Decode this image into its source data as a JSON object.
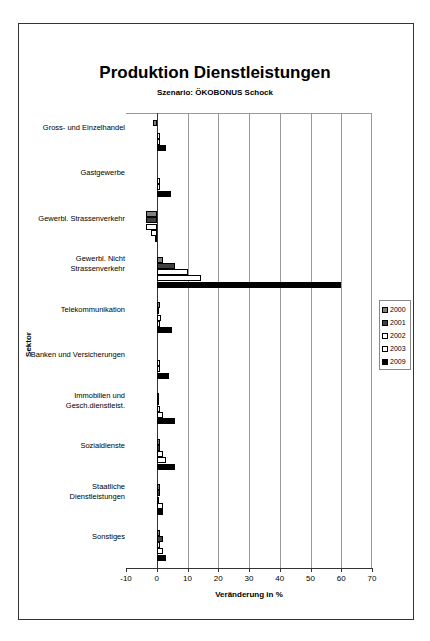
{
  "chart_data": {
    "type": "bar",
    "orientation": "horizontal",
    "title": "Produktion Dienstleistungen",
    "subtitle": "Szenario: ÖKOBONUS Schock",
    "xlabel": "Veränderung in %",
    "ylabel": "Sektor",
    "xlim": [
      -10,
      70
    ],
    "xticks": [
      "-10",
      "0",
      "10",
      "20",
      "30",
      "40",
      "50",
      "60",
      "70"
    ],
    "grid": true,
    "legend_position": "right",
    "categories": [
      "Gross- und Einzelhandel",
      "Gastgewerbe",
      "Gewerbl. Strassenverkehr",
      "Gewerbl. Nicht Strassenverkehr",
      "Telekommunikation",
      "Banken und Versicherungen",
      "Immobilien und Gesch.dienstleist.",
      "Sozialdienste",
      "Staatliche Dienstleistungen",
      "Sonstiges"
    ],
    "series": [
      {
        "name": "2000",
        "color": "#808080",
        "values": [
          -1.2,
          0,
          -3.5,
          2,
          1,
          0,
          0.5,
          1,
          1,
          1
        ]
      },
      {
        "name": "2001",
        "color": "#404040",
        "values": [
          0,
          0,
          -3.5,
          6,
          0.5,
          0,
          0.5,
          1,
          1,
          2
        ]
      },
      {
        "name": "2002",
        "color": "#ffffff",
        "values": [
          1,
          1,
          -3.5,
          10,
          1.5,
          1,
          1,
          2,
          0.5,
          1
        ]
      },
      {
        "name": "2003",
        "color": "#ffffff",
        "values": [
          1,
          1,
          -2,
          14.5,
          1,
          1,
          2,
          3,
          2,
          2
        ]
      },
      {
        "name": "2009",
        "color": "#000000",
        "values": [
          3,
          4.5,
          -0.7,
          60,
          5,
          4,
          6,
          6,
          2,
          3
        ]
      }
    ]
  },
  "labels": {
    "cat0": [
      "Gross- und Einzelhandel"
    ],
    "cat1": [
      "Gastgewerbe"
    ],
    "cat2": [
      "Gewerbl. Strassenverkehr"
    ],
    "cat3": [
      "Gewerbl. Nicht",
      "Strassenverkehr"
    ],
    "cat4": [
      "Telekommunikation"
    ],
    "cat5": [
      "Banken und Versicherungen"
    ],
    "cat6": [
      "Immobilien und",
      "Gesch.dienstleist."
    ],
    "cat7": [
      "Sozialdienste"
    ],
    "cat8": [
      "Staatliche",
      "Dienstleistungen"
    ],
    "cat9": [
      "Sonstiges"
    ]
  }
}
